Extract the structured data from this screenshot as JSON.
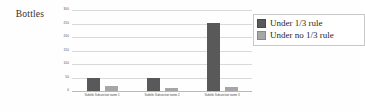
{
  "chart_data": {
    "type": "bar",
    "title": "",
    "ylabel": "Bottles",
    "xlabel": "",
    "ylim": [
      0,
      300
    ],
    "grid": true,
    "legend_position": "right",
    "yticks": [
      300,
      250,
      200,
      150,
      100,
      50,
      0
    ],
    "ytick_labels": [
      "300",
      "250",
      "200",
      "150",
      "100",
      "50",
      "0"
    ],
    "categories": [
      "Subtitle Subsection name 1",
      "Subtitle Subsection name 2",
      "Subtitle Subsection name 3"
    ],
    "series": [
      {
        "name": "Under 1/3 rule",
        "color": "#595959",
        "values": [
          48,
          50,
          252
        ]
      },
      {
        "name": "Under no 1/3 rule",
        "color": "#a6a6a6",
        "values": [
          20,
          12,
          15
        ]
      }
    ]
  },
  "legend": {
    "items": [
      {
        "label": "Under 1/3 rule",
        "color": "#595959"
      },
      {
        "label": "Under no 1/3 rule",
        "color": "#a6a6a6"
      }
    ]
  },
  "colors": {
    "series_dark": "#595959",
    "series_light": "#a6a6a6",
    "gridline": "#d9d9d9",
    "axis": "#b9b9b9",
    "background": "#ffffff"
  }
}
